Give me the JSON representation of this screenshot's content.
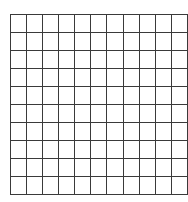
{
  "canvas": {
    "width": 188,
    "height": 202,
    "background_color": "#ffffff"
  },
  "grid": {
    "name": "empty-grid",
    "columns": 11,
    "rows": 10,
    "cell_width": 15.1,
    "cell_height": 17.0,
    "left": 10,
    "top": 14,
    "right": 176,
    "bottom": 184,
    "line_color": "#3a3a3a",
    "line_width": 1.5,
    "border_color": "#3a3a3a",
    "border_width": 1.5,
    "cell_fill": "#ffffff",
    "cell_text": ""
  },
  "chart_data": {
    "type": "table",
    "title": "",
    "xlabel": "",
    "ylabel": "",
    "columns": 11,
    "rows": 10,
    "column_headers": [
      "",
      "",
      "",
      "",
      "",
      "",
      "",
      "",
      "",
      "",
      ""
    ],
    "values": [
      [
        "",
        "",
        "",
        "",
        "",
        "",
        "",
        "",
        "",
        "",
        ""
      ],
      [
        "",
        "",
        "",
        "",
        "",
        "",
        "",
        "",
        "",
        "",
        ""
      ],
      [
        "",
        "",
        "",
        "",
        "",
        "",
        "",
        "",
        "",
        "",
        ""
      ],
      [
        "",
        "",
        "",
        "",
        "",
        "",
        "",
        "",
        "",
        "",
        ""
      ],
      [
        "",
        "",
        "",
        "",
        "",
        "",
        "",
        "",
        "",
        "",
        ""
      ],
      [
        "",
        "",
        "",
        "",
        "",
        "",
        "",
        "",
        "",
        "",
        ""
      ],
      [
        "",
        "",
        "",
        "",
        "",
        "",
        "",
        "",
        "",
        "",
        ""
      ],
      [
        "",
        "",
        "",
        "",
        "",
        "",
        "",
        "",
        "",
        "",
        ""
      ],
      [
        "",
        "",
        "",
        "",
        "",
        "",
        "",
        "",
        "",
        "",
        ""
      ],
      [
        "",
        "",
        "",
        "",
        "",
        "",
        "",
        "",
        "",
        "",
        ""
      ]
    ],
    "grid": true,
    "legend": null,
    "annotations": []
  }
}
